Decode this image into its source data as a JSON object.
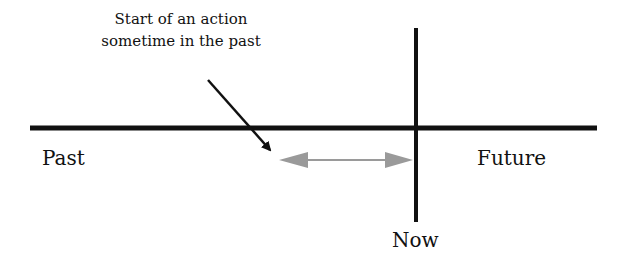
{
  "diagram": {
    "type": "timeline",
    "annotation": {
      "line1": "Start of an action",
      "line2": "sometime in the past"
    },
    "labels": {
      "past": "Past",
      "future": "Future",
      "now": "Now"
    },
    "colors": {
      "timeline": "#111111",
      "duration_arrow": "#9a9a9a",
      "pointer_arrow": "#111111"
    }
  }
}
